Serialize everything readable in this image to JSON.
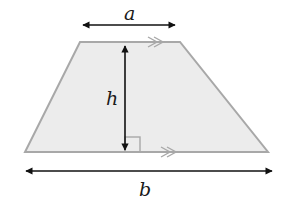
{
  "diagram": {
    "type": "trapezium",
    "labels": {
      "top_base": "a",
      "height": "h",
      "bottom_base": "b"
    },
    "colors": {
      "fill": "#ececec",
      "outline": "#a8a8a8",
      "arrow": "#111111",
      "parallel_marks": "#a8a8a8"
    },
    "annotations": {
      "parallel_marks": ">>",
      "right_angle_marker": true
    }
  }
}
